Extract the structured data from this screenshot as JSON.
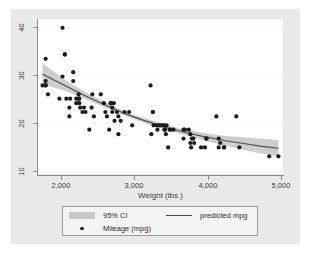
{
  "figure": {
    "name": "mpg-vs-weight-scatter",
    "background_color": "#e9e9e9",
    "plot_background_color": "#ffffff"
  },
  "axes": {
    "y_ticks": [
      "10",
      "20",
      "30",
      "40"
    ],
    "x_ticks": [
      "2,000",
      "3,000",
      "4,000",
      "5,000"
    ],
    "x_title": "Weight (lbs.)",
    "y_title": ""
  },
  "legend": {
    "ci_label": "95% CI",
    "line_label": "predicted mpg",
    "points_label": "Mileage (mpg)"
  },
  "chart_data": {
    "type": "scatter",
    "title": "",
    "subtitle": "",
    "xlabel": "Weight (lbs.)",
    "ylabel": "",
    "xlim": [
      1700,
      4900
    ],
    "ylim": [
      8,
      43
    ],
    "xticks": [
      2000,
      3000,
      4000,
      5000
    ],
    "yticks": [
      10,
      20,
      30,
      40
    ],
    "grid": "horizontal",
    "legend_position": "below-plot",
    "colors": {
      "point": "#1c1c1c",
      "fit_line": "#4a4a4a",
      "ci_band": "#c9c9c9",
      "axis": "#8c8c8c",
      "gridline": "#f2f2f2"
    },
    "series": [
      {
        "name": "Mileage (mpg)",
        "type": "scatter",
        "x": [
          1760,
          1800,
          1800,
          1800,
          1830,
          1800,
          1980,
          2020,
          2020,
          2050,
          2050,
          2070,
          2110,
          2110,
          2120,
          2160,
          2160,
          2200,
          2200,
          2230,
          2230,
          2240,
          2240,
          2250,
          2280,
          2300,
          2320,
          2370,
          2400,
          2410,
          2430,
          2520,
          2560,
          2580,
          2600,
          2630,
          2650,
          2650,
          2670,
          2670,
          2690,
          2700,
          2730,
          2750,
          2750,
          2780,
          2830,
          2890,
          2930,
          3170,
          3180,
          3200,
          3200,
          3210,
          3250,
          3260,
          3280,
          3300,
          3330,
          3350,
          3350,
          3360,
          3370,
          3380,
          3400,
          3420,
          3430,
          3470,
          3600,
          3600,
          3620,
          3670,
          3690,
          3690,
          3700,
          3710,
          3730,
          3740,
          3830,
          3880,
          3900,
          3900,
          4030,
          4060,
          4060,
          4080,
          4130,
          4130,
          4290,
          4330,
          4720,
          4840
        ],
        "y": [
          28,
          28,
          28,
          34,
          26,
          29,
          25,
          41,
          30,
          35,
          35,
          25,
          23,
          21,
          25,
          29,
          31,
          24,
          25,
          26,
          25,
          25,
          24,
          23,
          22,
          23,
          22,
          18,
          23,
          26,
          21,
          26,
          24,
          22,
          21,
          18,
          24,
          24,
          23,
          22,
          24,
          20,
          22,
          17,
          21,
          20,
          22,
          22,
          19,
          28,
          17,
          22,
          22,
          19,
          19,
          18,
          19,
          19,
          19,
          19,
          18,
          18,
          17,
          19,
          14,
          18,
          18,
          18,
          16,
          18,
          18,
          18,
          15,
          17,
          14,
          16,
          16,
          15,
          14,
          14,
          16,
          16,
          21,
          16,
          14,
          15,
          14,
          14,
          21,
          14,
          12,
          12
        ]
      },
      {
        "name": "predicted mpg",
        "type": "line",
        "x": [
          1760,
          1900,
          2050,
          2200,
          2350,
          2500,
          2650,
          2800,
          2950,
          3100,
          3250,
          3400,
          3550,
          3700,
          3850,
          4000,
          4150,
          4300,
          4450,
          4600,
          4840
        ],
        "y": [
          30.6,
          29.3,
          28.0,
          26.7,
          25.4,
          24.2,
          23.0,
          21.9,
          20.9,
          20.0,
          19.2,
          18.4,
          17.7,
          17.1,
          16.5,
          16.0,
          15.5,
          15.1,
          14.7,
          14.3,
          13.8
        ]
      },
      {
        "name": "95% CI",
        "type": "band",
        "x": [
          1760,
          1900,
          2050,
          2200,
          2350,
          2500,
          2650,
          2800,
          2950,
          3100,
          3250,
          3400,
          3550,
          3700,
          3850,
          4000,
          4150,
          4300,
          4450,
          4600,
          4840
        ],
        "y_lower": [
          28.2,
          27.6,
          26.8,
          25.8,
          24.7,
          23.6,
          22.5,
          21.4,
          20.4,
          19.5,
          18.7,
          17.9,
          17.1,
          16.4,
          15.7,
          15.0,
          14.4,
          13.8,
          13.2,
          12.7,
          12.0
        ],
        "y_upper": [
          33.0,
          31.2,
          29.3,
          27.7,
          26.2,
          24.9,
          23.6,
          22.4,
          21.4,
          20.6,
          19.8,
          19.0,
          18.3,
          17.8,
          17.3,
          16.9,
          16.6,
          16.4,
          16.2,
          16.0,
          15.7
        ]
      }
    ]
  }
}
